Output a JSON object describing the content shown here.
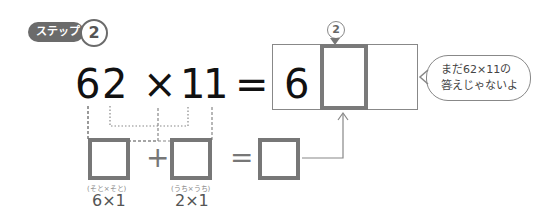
{
  "step_badge": {
    "label": "ステップ",
    "number": "2"
  },
  "equation": {
    "left_a": "6",
    "left_b": "2",
    "times": "×",
    "right_a": "1",
    "right_b": "1",
    "equals": "="
  },
  "answer_box": {
    "cells": [
      "6",
      "",
      ""
    ],
    "marker": "2"
  },
  "speech_bubble": {
    "line1": "まだ62×11の",
    "line2": "答えじゃないよ",
    "ruby": "こた"
  },
  "sum_row": {
    "plus": "+",
    "equals": "=",
    "items": [
      {
        "label": "(そと×そと)",
        "expr": "6×1"
      },
      {
        "label": "(うち×うち)",
        "expr": "2×1"
      }
    ]
  }
}
